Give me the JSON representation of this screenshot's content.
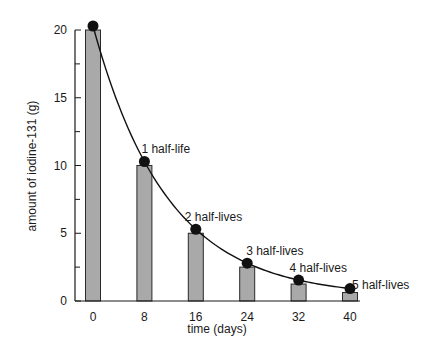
{
  "chart_data": {
    "type": "bar",
    "title": "",
    "xlabel": "time (days)",
    "ylabel": "amount of iodine-131 (g)",
    "categories": [
      "0",
      "8",
      "16",
      "24",
      "32",
      "40"
    ],
    "x": [
      0,
      8,
      16,
      24,
      32,
      40
    ],
    "values": [
      20,
      10,
      5,
      2.5,
      1.25,
      0.625
    ],
    "series": [
      {
        "name": "amount remaining (bars)",
        "type": "bar",
        "values": [
          20,
          10,
          5,
          2.5,
          1.25,
          0.625
        ]
      },
      {
        "name": "decay curve",
        "type": "line",
        "values": [
          20,
          10,
          5,
          2.5,
          1.25,
          0.625
        ]
      }
    ],
    "ylim": [
      0,
      20
    ],
    "xlim": [
      0,
      40
    ],
    "yticks": [
      0,
      5,
      10,
      15,
      20
    ],
    "yminor_ticks": [
      2.5,
      7.5,
      12.5,
      17.5
    ],
    "xticks": [
      0,
      8,
      16,
      24,
      32,
      40
    ],
    "grid": false,
    "annotations": [
      {
        "x": 8,
        "y": 10,
        "text": "1 half-life"
      },
      {
        "x": 16,
        "y": 5,
        "text": "2 half-lives"
      },
      {
        "x": 24,
        "y": 2.5,
        "text": "3 half-lives"
      },
      {
        "x": 32,
        "y": 1.25,
        "text": "4 half-lives"
      },
      {
        "x": 40,
        "y": 0.625,
        "text": "5 half-lives"
      }
    ],
    "colors": {
      "bar_fill": "#a9a9a9",
      "bar_stroke": "#2a2a2a",
      "curve": "#111111",
      "marker": "#111111"
    }
  }
}
